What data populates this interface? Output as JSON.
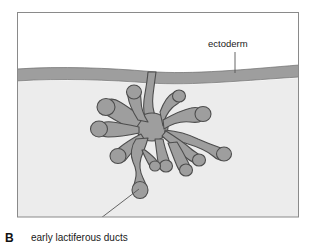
{
  "figure": {
    "panel_letter": "B",
    "caption": "early lactiferous ducts",
    "labels": {
      "ectoderm": "ectoderm"
    },
    "colors": {
      "frame_border": "#8a8a8a",
      "upper_background": "#ffffff",
      "ectoderm_band": "#9e9e9e",
      "mesenchyme": "#ececec",
      "duct_fill": "#9e9e9e",
      "duct_outline": "#4d4d4d",
      "leader_line": "#555555",
      "text": "#1a1a1a"
    },
    "regions": [
      {
        "name": "upper-space",
        "description": "white area above ectoderm"
      },
      {
        "name": "ectoderm-band",
        "description": "gray horizontal band representing surface ectoderm"
      },
      {
        "name": "mesenchyme",
        "description": "light gray region below ectoderm containing the ducts"
      },
      {
        "name": "duct-tree",
        "description": "branching gray structure of early lactiferous ducts with club-shaped tips"
      }
    ],
    "annotations": [
      {
        "name": "ectoderm-leader",
        "label": "ectoderm",
        "from": [
          235,
          52
        ],
        "to": [
          235,
          72
        ]
      },
      {
        "name": "ducts-leader",
        "label": "early lactiferous ducts",
        "from": [
          84,
          231
        ],
        "to": [
          139,
          189
        ]
      }
    ]
  }
}
